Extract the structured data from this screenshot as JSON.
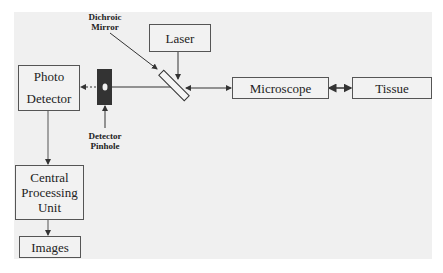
{
  "diagram": {
    "title": "",
    "nodes": {
      "laser": {
        "label": "Laser"
      },
      "photo_detector": {
        "line1": "Photo",
        "line2": "Detector"
      },
      "microscope": {
        "label": "Microscope"
      },
      "tissue": {
        "label": "Tissue"
      },
      "cpu": {
        "line1": "Central",
        "line2": "Processing",
        "line3": "Unit"
      },
      "images": {
        "label": "Images"
      }
    },
    "labels": {
      "dichroic_mirror": {
        "line1": "Dichroic",
        "line2": "Mirror"
      },
      "detector_pinhole": {
        "line1": "Detector",
        "line2": "Pinhole"
      }
    },
    "edges": [
      {
        "from": "laser",
        "to": "dichroic_mirror",
        "style": "solid"
      },
      {
        "from": "microscope",
        "to": "dichroic_mirror",
        "style": "solid",
        "bidirectional": true
      },
      {
        "from": "microscope",
        "to": "tissue",
        "style": "solid",
        "bidirectional": true
      },
      {
        "from": "dichroic_mirror",
        "to": "detector_pinhole",
        "style": "solid"
      },
      {
        "from": "detector_pinhole",
        "to": "photo_detector",
        "style": "dotted"
      },
      {
        "from": "photo_detector",
        "to": "cpu",
        "style": "solid"
      },
      {
        "from": "cpu",
        "to": "images",
        "style": "solid"
      }
    ],
    "colors": {
      "background": "#f0f0f0",
      "line": "#333333",
      "pinhole": "#333333"
    }
  }
}
